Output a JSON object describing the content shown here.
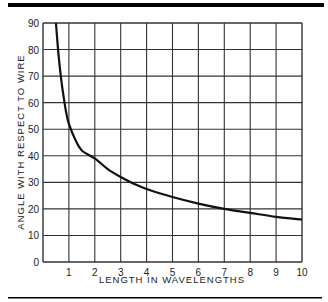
{
  "chart_data": {
    "type": "line",
    "title": "",
    "xlabel": "LENGTH  IN  WAVELENGTHS",
    "ylabel": "ANGLE  WITH  RESPECT  TO  WIRE",
    "xlim": [
      0,
      10
    ],
    "ylim": [
      0,
      90
    ],
    "x_ticks": [
      "1",
      "2",
      "3",
      "4",
      "5",
      "6",
      "7",
      "8",
      "9",
      "10"
    ],
    "y_ticks": [
      "0",
      "10",
      "20",
      "30",
      "40",
      "50",
      "60",
      "70",
      "80",
      "90"
    ],
    "grid": true,
    "legend": null,
    "series": [
      {
        "name": "angle",
        "x": [
          0.5,
          0.6,
          0.7,
          0.8,
          0.9,
          1.0,
          1.25,
          1.5,
          2,
          2.5,
          3,
          3.5,
          4,
          5,
          6,
          7,
          8,
          9,
          10
        ],
        "y": [
          90,
          78,
          69,
          62,
          56,
          52,
          46,
          42,
          39,
          35,
          32,
          29.5,
          27.5,
          24.5,
          22,
          20,
          18.5,
          17,
          16
        ]
      }
    ]
  },
  "colors": {
    "line": "#111111",
    "grid": "#333333",
    "rule": "#000000"
  }
}
